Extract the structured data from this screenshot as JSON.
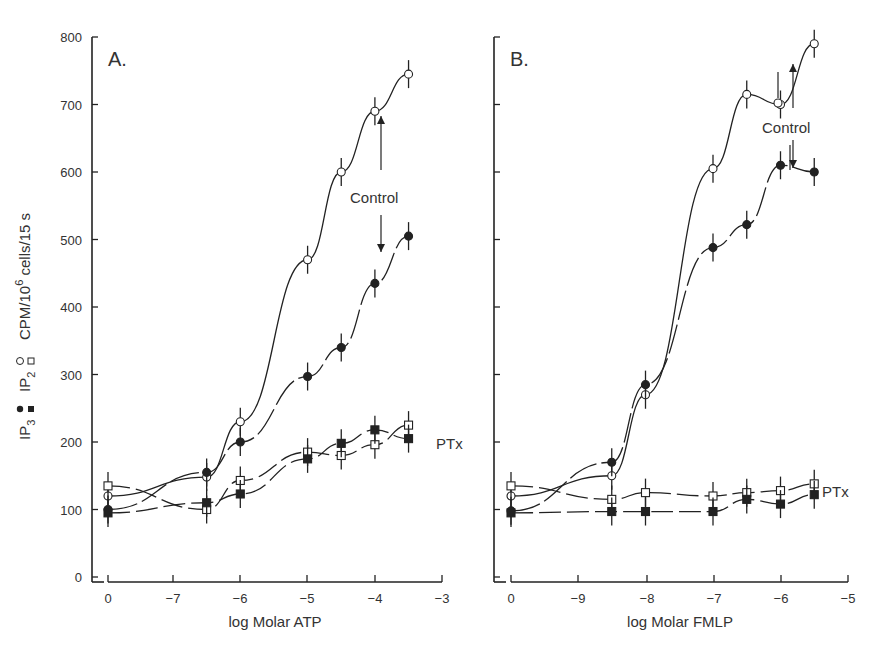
{
  "chart_data": [
    {
      "type": "line",
      "panel": "A.",
      "xlabel": "log Molar ATP",
      "ylabel": "IP3 ●■  IP2 ○□   CPM/10^6 cells/15 s",
      "x_ticks": [
        "0",
        "-7",
        "-6",
        "-5",
        "-4",
        "-3"
      ],
      "y_ticks": [
        "0",
        "100",
        "200",
        "300",
        "400",
        "500",
        "600",
        "700",
        "800"
      ],
      "ylim": [
        0,
        800
      ],
      "annotations": [
        "Control",
        "PTx"
      ],
      "x": [
        0,
        -6.5,
        -6,
        -5,
        -4.5,
        -4,
        -3.5
      ],
      "series": [
        {
          "name": "IP2 Control (open circle)",
          "values": [
            120,
            148,
            230,
            470,
            600,
            690,
            745
          ]
        },
        {
          "name": "IP3 Control (filled circle)",
          "values": [
            100,
            155,
            200,
            297,
            340,
            435,
            505
          ]
        },
        {
          "name": "IP2 PTx (open square)",
          "values": [
            135,
            100,
            143,
            185,
            180,
            196,
            225
          ]
        },
        {
          "name": "IP3 PTx (filled square)",
          "values": [
            95,
            110,
            123,
            175,
            198,
            218,
            205
          ]
        }
      ]
    },
    {
      "type": "line",
      "panel": "B.",
      "xlabel": "log Molar FMLP",
      "x_ticks": [
        "0",
        "-9",
        "-8",
        "-7",
        "-6",
        "-5"
      ],
      "ylim": [
        0,
        800
      ],
      "annotations": [
        "Control",
        "PTx"
      ],
      "x": [
        0,
        -8.5,
        -8,
        -7,
        -6.5,
        -6,
        -5.5
      ],
      "series": [
        {
          "name": "IP2 Control (open circle)",
          "values": [
            120,
            150,
            270,
            605,
            715,
            700,
            790
          ]
        },
        {
          "name": "IP3 Control (filled circle)",
          "values": [
            98,
            170,
            285,
            488,
            522,
            610,
            600
          ]
        },
        {
          "name": "IP2 PTx (open square)",
          "values": [
            135,
            115,
            125,
            120,
            125,
            128,
            138
          ]
        },
        {
          "name": "IP3 PTx (filled square)",
          "values": [
            95,
            97,
            97,
            97,
            115,
            108,
            122
          ]
        }
      ]
    }
  ],
  "labels": {
    "panel_a": "A.",
    "panel_b": "B.",
    "xlabel_a": "log Molar ATP",
    "xlabel_b": "log Molar FMLP",
    "control": "Control",
    "ptx": "PTx",
    "ylabel_ip3": "IP",
    "ylabel_ip3_sub": "3",
    "ylabel_ip2": "IP",
    "ylabel_ip2_sub": "2",
    "ylabel_units": "CPM/10",
    "ylabel_units_sup": "6",
    "ylabel_units_rest": " cells/15 s"
  }
}
